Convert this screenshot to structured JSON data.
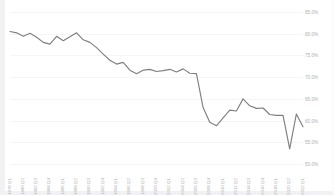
{
  "chart": {
    "title": "",
    "y_axis_name": "y-axis-labels",
    "x_axis_name": "x-axis-labels"
  },
  "colors": {
    "line": "#7f7f7f",
    "gridline": "#f4f5f7",
    "tick_label": "#b0b0b4",
    "background": "#ffffff",
    "frame": "#f2f2f4"
  },
  "chart_data": {
    "type": "line",
    "title": "",
    "subtitle": "",
    "xlabel": "",
    "ylabel": "",
    "grid": true,
    "legend": null,
    "ylim": [
      50.0,
      85.0
    ],
    "ytick_labels": [
      "85.0%",
      "80.0%",
      "75.0%",
      "70.0%",
      "65.0%",
      "60.0%",
      "55.0%",
      "50.0%"
    ],
    "ytick_values": [
      85.0,
      80.0,
      75.0,
      70.0,
      65.0,
      60.0,
      55.0,
      50.0
    ],
    "xtick_labels": [
      "1978 Q1",
      "1980 Q2",
      "1982 Q3",
      "1984 Q4",
      "1986 Q1",
      "1988 Q2",
      "1990 Q3",
      "1992 Q4",
      "1994 Q1",
      "1996 Q2",
      "1998 Q3",
      "2000 Q4",
      "2002 Q1",
      "2004 Q2",
      "2006 Q3",
      "2008 Q4",
      "2010 Q1",
      "2012 Q2",
      "2014 Q3",
      "2016 Q4",
      "2018 Q1",
      "2020 Q2",
      "2022 Q1"
    ],
    "categories": [
      "1978 Q1",
      "1979 Q1",
      "1980 Q2",
      "1981 Q2",
      "1982 Q3",
      "1983 Q3",
      "1984 Q4",
      "1985 Q4",
      "1986 Q1",
      "1987 Q1",
      "1988 Q2",
      "1989 Q2",
      "1990 Q3",
      "1991 Q3",
      "1992 Q4",
      "1993 Q4",
      "1994 Q1",
      "1995 Q1",
      "1996 Q2",
      "1997 Q2",
      "1998 Q3",
      "1999 Q3",
      "2000 Q4",
      "2001 Q4",
      "2002 Q1",
      "2003 Q1",
      "2004 Q2",
      "2005 Q2",
      "2006 Q3",
      "2007 Q3",
      "2008 Q4",
      "2009 Q4",
      "2010 Q1",
      "2011 Q1",
      "2012 Q2",
      "2013 Q2",
      "2014 Q3",
      "2015 Q3",
      "2016 Q4",
      "2017 Q4",
      "2018 Q1",
      "2019 Q1",
      "2020 Q2",
      "2021 Q2",
      "2022 Q1"
    ],
    "values": [
      80.5,
      80.2,
      79.4,
      80.1,
      79.2,
      78.0,
      77.6,
      79.4,
      78.4,
      79.3,
      80.2,
      78.6,
      78.0,
      76.8,
      75.3,
      73.9,
      73.0,
      73.4,
      71.6,
      70.8,
      71.6,
      71.8,
      71.3,
      71.5,
      71.8,
      71.2,
      71.9,
      70.9,
      70.8,
      63.0,
      59.6,
      58.8,
      60.6,
      62.4,
      62.2,
      65.0,
      63.4,
      62.8,
      62.9,
      61.4,
      61.2,
      61.2,
      53.5,
      61.5,
      58.6
    ],
    "series": [
      {
        "name": "rate",
        "values": [
          80.5,
          80.2,
          79.4,
          80.1,
          79.2,
          78.0,
          77.6,
          79.4,
          78.4,
          79.3,
          80.2,
          78.6,
          78.0,
          76.8,
          75.3,
          73.9,
          73.0,
          73.4,
          71.6,
          70.8,
          71.6,
          71.8,
          71.3,
          71.5,
          71.8,
          71.2,
          71.9,
          70.9,
          70.8,
          63.0,
          59.6,
          58.8,
          60.6,
          62.4,
          62.2,
          65.0,
          63.4,
          62.8,
          62.9,
          61.4,
          61.2,
          61.2,
          53.5,
          61.5,
          58.6
        ]
      }
    ]
  }
}
